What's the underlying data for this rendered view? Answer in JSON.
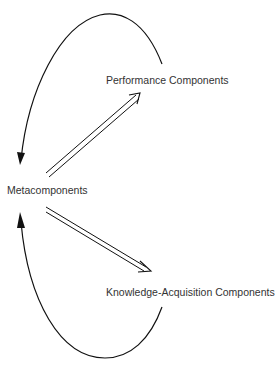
{
  "diagram": {
    "nodes": {
      "meta": {
        "label": "Metacomponents"
      },
      "performance": {
        "label": "Performance Components"
      },
      "knowledge": {
        "label": "Knowledge-Acquisition Components"
      }
    },
    "edges": [
      {
        "from": "Metacomponents",
        "to": "Performance Components",
        "style": "double-line arrow"
      },
      {
        "from": "Metacomponents",
        "to": "Knowledge-Acquisition Components",
        "style": "double-line arrow"
      },
      {
        "from": "Performance Components",
        "to": "Metacomponents",
        "style": "curved feedback arrow"
      },
      {
        "from": "Knowledge-Acquisition Components",
        "to": "Metacomponents",
        "style": "curved feedback arrow"
      }
    ],
    "colors": {
      "line": "#111111",
      "text": "#333333",
      "background": "#ffffff"
    }
  }
}
